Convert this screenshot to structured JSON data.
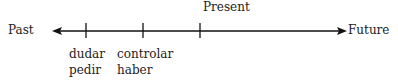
{
  "timeline": {
    "left_label": "Past",
    "right_label": "Future",
    "top_label": "Present",
    "ticks": [
      {
        "x": 86,
        "words": [
          "dudar",
          "pedir"
        ]
      },
      {
        "x": 143,
        "words": [
          "controlar",
          "haber"
        ]
      },
      {
        "x": 200,
        "label": "Present"
      }
    ]
  }
}
